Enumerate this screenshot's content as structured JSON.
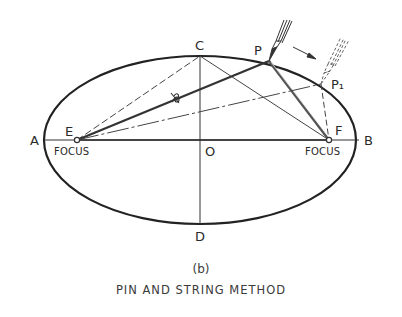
{
  "figure": {
    "subfigure_label": "(b)",
    "title": "PIN AND STRING METHOD"
  },
  "points": {
    "A": "A",
    "B": "B",
    "C": "C",
    "D": "D",
    "O": "O",
    "E": "E",
    "F": "F",
    "P": "P",
    "P1": "P₁"
  },
  "focus_labels": {
    "left": "FOCUS",
    "right": "FOCUS"
  },
  "colors": {
    "ink": "#2a2a2a",
    "background": "#ffffff"
  }
}
